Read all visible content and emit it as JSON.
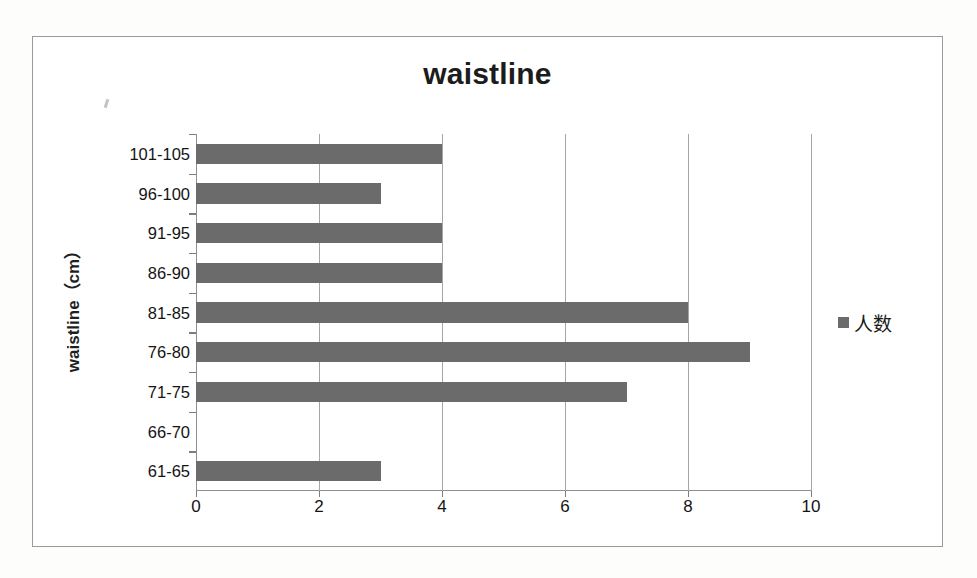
{
  "chart_data": {
    "type": "bar",
    "orientation": "horizontal",
    "title": "waistline",
    "xlabel": "",
    "ylabel": "waistline（cm）",
    "categories": [
      "61-65",
      "66-70",
      "71-75",
      "76-80",
      "81-85",
      "86-90",
      "91-95",
      "96-100",
      "101-105"
    ],
    "values": [
      3,
      0,
      7,
      9,
      8,
      4,
      4,
      3,
      4
    ],
    "series": [
      {
        "name": "人数",
        "values": [
          3,
          0,
          7,
          9,
          8,
          4,
          4,
          3,
          4
        ]
      }
    ],
    "xlim": [
      0,
      10
    ],
    "xticks": [
      0,
      2,
      4,
      6,
      8,
      10
    ],
    "xtick_labels": [
      "0",
      "2",
      "4",
      "6",
      "8",
      "10"
    ],
    "gridlines": "vertical",
    "legend": {
      "position": "right",
      "entries": [
        "人数"
      ]
    },
    "bar_color": "#6b6b6b",
    "grid_color": "#a6a6a6",
    "axis_color": "#8f8f8f",
    "title_color": "#1c1c1c",
    "background": "#ffffff"
  },
  "chart": {
    "title": "waistline",
    "y_axis_title": "waistline（cm）"
  },
  "legend": {
    "label": "人数"
  },
  "x_axis": {
    "labels": [
      "0",
      "2",
      "4",
      "6",
      "8",
      "10"
    ]
  },
  "y_axis": {
    "labels": [
      "101-105",
      "96-100",
      "91-95",
      "86-90",
      "81-85",
      "76-80",
      "71-75",
      "66-70",
      "61-65"
    ]
  }
}
